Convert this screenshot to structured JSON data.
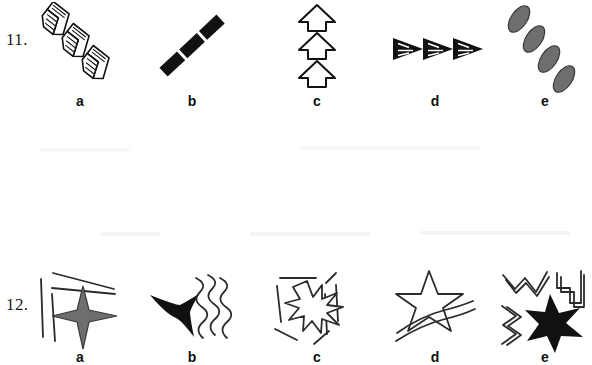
{
  "page": {
    "type": "visual-reasoning-worksheet",
    "background_color": "#ffffff",
    "ink_color": "#111111",
    "gray_fill_color": "#6e6e6e"
  },
  "items": [
    {
      "number": "11.",
      "options": [
        {
          "label": "a",
          "figure_name": "three-striped-chevrons-diagonal",
          "description": "Three open 3D chevron arrowheads with internal parallel stripes arranged along a diagonal from upper-left to lower-right",
          "count": 3,
          "fill": "white",
          "stroke": "#111111"
        },
        {
          "label": "b",
          "figure_name": "three-solid-bars-diagonal",
          "description": "Three thick solid black parallelogram bars aligned along a diagonal from lower-left to upper-right",
          "count": 3,
          "fill": "#111111",
          "stroke": "none"
        },
        {
          "label": "c",
          "figure_name": "three-outlined-up-arrows-stacked",
          "description": "Three outlined upward-pointing block arrows stacked vertically",
          "count": 3,
          "fill": "white",
          "stroke": "#111111"
        },
        {
          "label": "d",
          "figure_name": "three-striped-pennants-horizontal",
          "description": "Three black right-pointing pennant triangles with white internal stripes in a horizontal row",
          "count": 3,
          "fill": "#111111",
          "stroke": "#111111"
        },
        {
          "label": "e",
          "figure_name": "four-gray-ellipses-diagonal-chain",
          "description": "Four gray tilted ellipses forming a diagonal chain from upper-left to lower-right",
          "count": 4,
          "fill": "#6e6e6e",
          "stroke": "#3a3a3a"
        }
      ]
    },
    {
      "number": "12.",
      "options": [
        {
          "label": "a",
          "figure_name": "gray-four-point-star-with-straight-lines",
          "description": "Gray concave four-pointed star with two vertical straight lines at left and two converging straight lines above",
          "star_points": 4,
          "fill": "#6e6e6e",
          "stroke": "#3a3a3a",
          "accent_lines": 4,
          "accent_line_type": "straight"
        },
        {
          "label": "b",
          "figure_name": "black-three-point-star-with-wavy-lines",
          "description": "Solid black concave three-pointed star beside three vertical wavy lines",
          "star_points": 3,
          "fill": "#111111",
          "stroke": "none",
          "accent_lines": 3,
          "accent_line_type": "wavy"
        },
        {
          "label": "c",
          "figure_name": "outlined-nine-point-starburst-with-rays",
          "description": "Outlined nine-pointed starburst surrounded by radiating straight line segments",
          "star_points": 9,
          "fill": "white",
          "stroke": "#111111",
          "accent_lines": 7,
          "accent_line_type": "straight"
        },
        {
          "label": "d",
          "figure_name": "outlined-five-point-star-with-curved-swooshes",
          "description": "Outlined five-pointed star above three long curved swoosh lines",
          "star_points": 5,
          "fill": "white",
          "stroke": "#111111",
          "accent_lines": 3,
          "accent_line_type": "curved"
        },
        {
          "label": "e",
          "figure_name": "black-six-point-star-with-zigzag-lines",
          "description": "Solid black six-pointed star with three groups of zigzag lines above and to the left",
          "star_points": 6,
          "fill": "#111111",
          "stroke": "none",
          "accent_lines": 3,
          "accent_line_type": "zigzag"
        }
      ]
    }
  ]
}
